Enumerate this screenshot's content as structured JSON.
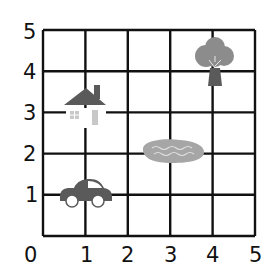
{
  "grid": {
    "x_min": 0,
    "x_max": 5,
    "y_min": 0,
    "y_max": 5,
    "line_color": "#111111",
    "x_labels": [
      "0",
      "1",
      "2",
      "3",
      "4",
      "5"
    ],
    "y_labels": [
      "1",
      "2",
      "3",
      "4",
      "5"
    ]
  },
  "objects": [
    {
      "name": "car",
      "x": 1,
      "y": 1,
      "color": "#5a5a5a"
    },
    {
      "name": "house",
      "x": 1,
      "y": 3,
      "color": "#5a5a5a"
    },
    {
      "name": "pond",
      "x": 3,
      "y": 2,
      "color": "#a6a6a6"
    },
    {
      "name": "tree",
      "x": 4,
      "y": 4,
      "color": "#8c8c8c"
    }
  ]
}
